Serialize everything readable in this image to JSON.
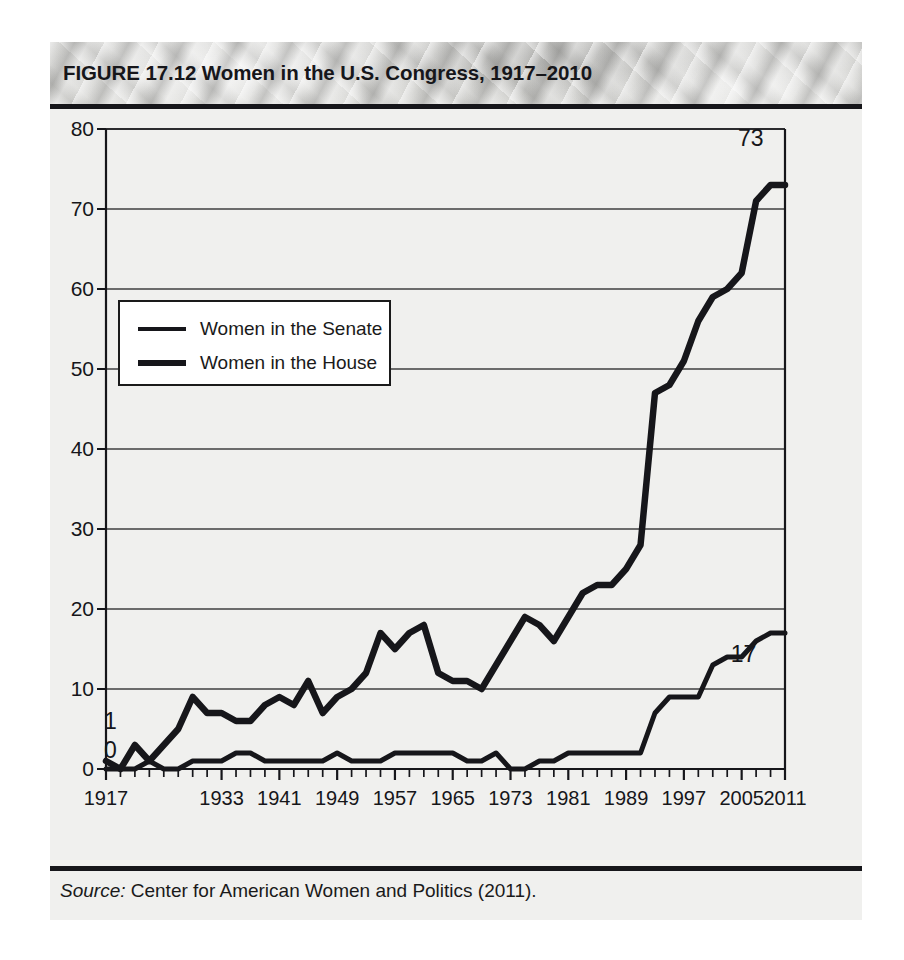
{
  "figure": {
    "title": "FIGURE 17.12  Women in the U.S. Congress, 1917–2010",
    "source_label": "Source:",
    "source_text": " Center for American Women and Politics (2011)."
  },
  "chart_data": {
    "type": "line",
    "title": "Women in the U.S. Congress, 1917–2010",
    "xlabel": "",
    "ylabel": "",
    "xlim": [
      1917,
      2011
    ],
    "ylim": [
      0,
      80
    ],
    "yticks": [
      0,
      10,
      20,
      30,
      40,
      50,
      60,
      70,
      80
    ],
    "ytick_labels": [
      "0",
      "10",
      "20",
      "30",
      "40",
      "50",
      "60",
      "70",
      "80"
    ],
    "xticks": [
      1917,
      1933,
      1941,
      1949,
      1957,
      1965,
      1973,
      1981,
      1989,
      1997,
      2005,
      2011
    ],
    "xtick_labels": [
      "1917",
      "1933",
      "1941",
      "1949",
      "1957",
      "1965",
      "1973",
      "1981",
      "1989",
      "1997",
      "2005",
      "2011"
    ],
    "minor_xtick_interval": 2,
    "grid": "horizontal",
    "legend_position": "upper-left-inset",
    "x": [
      1917,
      1919,
      1921,
      1923,
      1925,
      1927,
      1929,
      1931,
      1933,
      1935,
      1937,
      1939,
      1941,
      1943,
      1945,
      1947,
      1949,
      1951,
      1953,
      1955,
      1957,
      1959,
      1961,
      1963,
      1965,
      1967,
      1969,
      1971,
      1973,
      1975,
      1977,
      1979,
      1981,
      1983,
      1985,
      1987,
      1989,
      1991,
      1993,
      1995,
      1997,
      1999,
      2001,
      2003,
      2005,
      2007,
      2009,
      2011
    ],
    "series": [
      {
        "name": "Women in the House",
        "line_width": "thick",
        "color": "#16161a",
        "values": [
          1,
          0,
          3,
          1,
          3,
          5,
          9,
          7,
          7,
          6,
          6,
          8,
          9,
          8,
          11,
          7,
          9,
          10,
          12,
          17,
          15,
          17,
          18,
          12,
          11,
          11,
          10,
          13,
          16,
          19,
          18,
          16,
          19,
          22,
          23,
          23,
          25,
          28,
          47,
          48,
          51,
          56,
          59,
          60,
          62,
          71,
          73,
          73
        ]
      },
      {
        "name": "Women in the Senate",
        "line_width": "thin",
        "color": "#16161a",
        "values": [
          0,
          0,
          0,
          1,
          0,
          0,
          1,
          1,
          1,
          2,
          2,
          1,
          1,
          1,
          1,
          1,
          2,
          1,
          1,
          1,
          2,
          2,
          2,
          2,
          2,
          1,
          1,
          2,
          0,
          0,
          1,
          1,
          2,
          2,
          2,
          2,
          2,
          2,
          7,
          9,
          9,
          9,
          13,
          14,
          14,
          16,
          17,
          17
        ]
      }
    ],
    "annotations": [
      {
        "text": "1",
        "name": "house-start-value"
      },
      {
        "text": "0",
        "name": "senate-start-value"
      },
      {
        "text": "73",
        "name": "house-end-value"
      },
      {
        "text": "17",
        "name": "senate-end-value"
      }
    ],
    "legend": [
      {
        "label": "Women in the Senate"
      },
      {
        "label": "Women in the House"
      }
    ]
  },
  "colors": {
    "line": "#16161a",
    "panel_background": "#f0f0ee",
    "grid": "#3a3a3a",
    "header_band": "#cccccа"
  }
}
